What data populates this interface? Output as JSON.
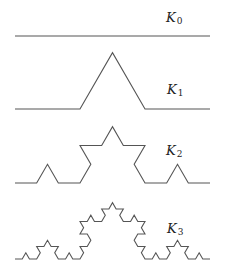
{
  "figure": {
    "background": "#ffffff",
    "stroke_color": "#555555",
    "stroke_width": 1.1,
    "label_color": "#222222",
    "x_start": 15,
    "x_end": 210,
    "curves": [
      {
        "name": "K0",
        "iteration": 0,
        "label_main": "K",
        "label_sub": "0",
        "baseline_y": 36,
        "label_x": 166,
        "label_y": 22
      },
      {
        "name": "K1",
        "iteration": 1,
        "label_main": "K",
        "label_sub": "1",
        "baseline_y": 109,
        "label_x": 167,
        "label_y": 94
      },
      {
        "name": "K2",
        "iteration": 2,
        "label_main": "K",
        "label_sub": "2",
        "baseline_y": 183,
        "label_x": 166,
        "label_y": 155
      },
      {
        "name": "K3",
        "iteration": 3,
        "label_main": "K",
        "label_sub": "3",
        "baseline_y": 259,
        "label_x": 167,
        "label_y": 233
      }
    ]
  }
}
